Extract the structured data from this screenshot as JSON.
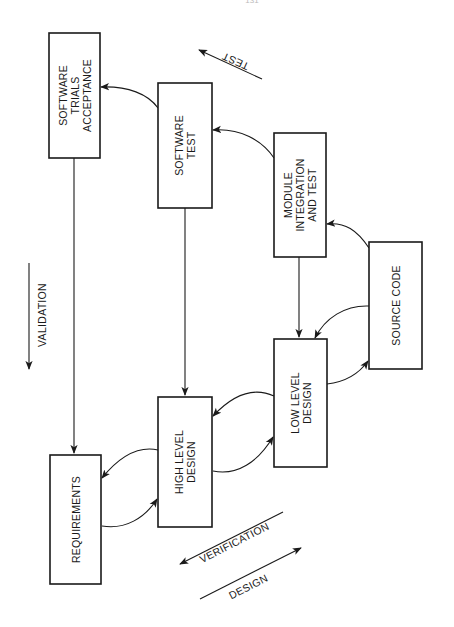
{
  "page_number": "131",
  "diagram": {
    "boxes": {
      "software_trials": [
        "SOFTWARE",
        "TRIALS",
        "ACCEPTANCE"
      ],
      "software_test": [
        "SOFTWARE",
        "TEST"
      ],
      "module_integration": [
        "MODULE",
        "INTEGRATION",
        "AND TEST"
      ],
      "source_code": [
        "SOURCE CODE"
      ],
      "low_level_design": [
        "LOW LEVEL",
        "DESIGN"
      ],
      "high_level_design": [
        "HIGH LEVEL",
        "DESIGN"
      ],
      "requirements": [
        "REQUIREMENTS"
      ]
    },
    "direction_labels": {
      "test": "TEST",
      "validation": "VALIDATION",
      "verification": "VERIFICATION",
      "design": "DESIGN"
    },
    "colors": {
      "ink": "#1a1a1a",
      "background": "#ffffff"
    }
  }
}
